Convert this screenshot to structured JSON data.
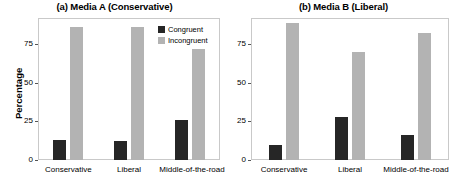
{
  "chart_data": {
    "type": "bar",
    "title": "",
    "categories": [
      "Conservative",
      "Liberal",
      "Middle-of-the-road"
    ],
    "ylabel": "Percentage",
    "xlabel": "",
    "ylim": [
      0,
      92
    ],
    "yticks": [
      0,
      25,
      50,
      75
    ],
    "ytick_labels": [
      "0",
      "25",
      "50",
      "75"
    ],
    "grid": false,
    "legend_position": "top-right of panel (a)",
    "panels": [
      {
        "title": "(a) Media A (Conservative)",
        "series": [
          {
            "name": "Congruent",
            "color": "#262626",
            "values": [
              13,
              12,
              26
            ]
          },
          {
            "name": "Incongruent",
            "color": "#b3b3b3",
            "values": [
              86,
              86,
              72
            ]
          }
        ]
      },
      {
        "title": "(b) Media B (Liberal)",
        "series": [
          {
            "name": "Congruent",
            "color": "#262626",
            "values": [
              10,
              28,
              16
            ]
          },
          {
            "name": "Incongruent",
            "color": "#b3b3b3",
            "values": [
              89,
              70,
              82
            ]
          }
        ]
      }
    ],
    "legend": [
      {
        "label": "Congruent",
        "color": "#262626"
      },
      {
        "label": "Incongruent",
        "color": "#b3b3b3"
      }
    ]
  }
}
